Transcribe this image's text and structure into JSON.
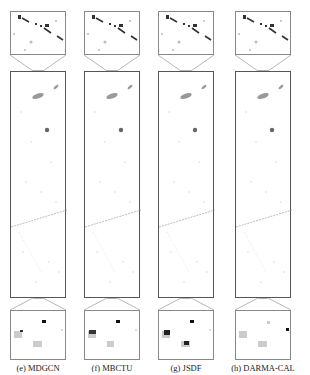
{
  "figure": {
    "panels": [
      {
        "label": "(e)  MDGCN"
      },
      {
        "label": "(f)  MBCTU"
      },
      {
        "label": "(g)  JSDF"
      },
      {
        "label": "(h)  DARMA-CAL"
      }
    ]
  }
}
